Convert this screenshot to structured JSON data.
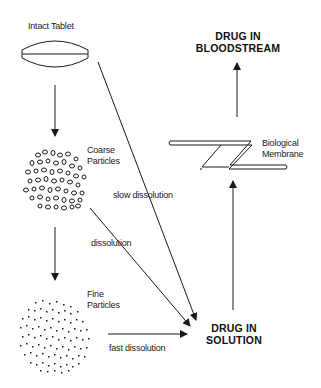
{
  "diagram": {
    "nodes": {
      "intact_tablet": "Intact Tablet",
      "coarse_particles_line1": "Coarse",
      "coarse_particles_line2": "Particles",
      "fine_particles_line1": "Fine",
      "fine_particles_line2": "Particles",
      "drug_in_solution_line1": "DRUG IN",
      "drug_in_solution_line2": "SOLUTION",
      "drug_in_bloodstream_line1": "DRUG IN",
      "drug_in_bloodstream_line2": "BLOODSTREAM",
      "biological_membrane_line1": "Biological",
      "biological_membrane_line2": "Membrane"
    },
    "edges": {
      "slow_dissolution": "slow dissolution",
      "dissolution": "dissolution",
      "fast_dissolution": "fast dissolution"
    },
    "colors": {
      "line": "#1a1a1a",
      "background": "#ffffff"
    }
  }
}
